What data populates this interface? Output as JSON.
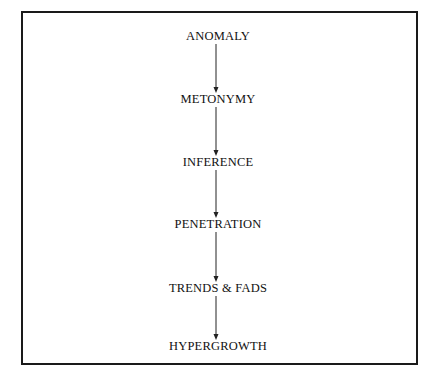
{
  "diagram": {
    "type": "vertical-flow",
    "nodes": [
      {
        "id": "anomaly",
        "label": "ANOMALY",
        "y": 36
      },
      {
        "id": "metonymy",
        "label": "METONYMY",
        "y": 99
      },
      {
        "id": "inference",
        "label": "INFERENCE",
        "y": 162
      },
      {
        "id": "penetration",
        "label": "PENETRATION",
        "y": 224
      },
      {
        "id": "trends-fads",
        "label": "TRENDS & FADS",
        "y": 288
      },
      {
        "id": "hypergrowth",
        "label": "HYPERGROWTH",
        "y": 346
      }
    ],
    "edges": [
      {
        "from": "anomaly",
        "to": "metonymy"
      },
      {
        "from": "metonymy",
        "to": "inference"
      },
      {
        "from": "inference",
        "to": "penetration"
      },
      {
        "from": "penetration",
        "to": "trends-fads"
      },
      {
        "from": "trends-fads",
        "to": "hypergrowth"
      }
    ],
    "colors": {
      "line": "#222222",
      "text": "#111111",
      "border": "#1a1a1a"
    }
  }
}
